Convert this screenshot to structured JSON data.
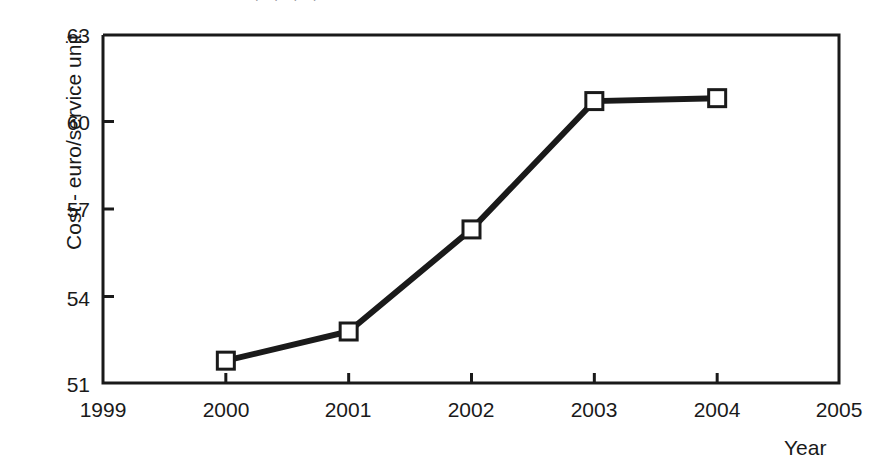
{
  "figure": {
    "width": 887,
    "height": 473,
    "background": "#ffffff",
    "top_clipped_text": ". . . ."
  },
  "plot_area": {
    "left": 103,
    "top": 34,
    "right": 840,
    "bottom": 384,
    "frame_color": "#1a1a1a",
    "frame_width": 3
  },
  "chart_data": {
    "type": "line",
    "title": "",
    "subtitle": "",
    "xlabel": "Year",
    "ylabel": "Cost - euro/service unit",
    "x": [
      2000,
      2001,
      2002,
      2003,
      2004
    ],
    "values": [
      51.8,
      52.8,
      56.3,
      60.7,
      60.8
    ],
    "series": [
      {
        "name": "Cost - euro/service unit",
        "x": [
          2000,
          2001,
          2002,
          2003,
          2004
        ],
        "values": [
          51.8,
          52.8,
          56.3,
          60.7,
          60.8
        ]
      }
    ],
    "xlim": [
      1999,
      2005
    ],
    "ylim": [
      51,
      63
    ],
    "xticks": [
      1999,
      2000,
      2001,
      2002,
      2003,
      2004,
      2005
    ],
    "xtick_labels": [
      "1999",
      "2000",
      "2001",
      "2002",
      "2003",
      "2004",
      "2005"
    ],
    "yticks": [
      51,
      54,
      57,
      60,
      63
    ],
    "ytick_labels": [
      "51",
      "54",
      "57",
      "60",
      "63"
    ],
    "grid": false,
    "legend": null,
    "legend_position": "none",
    "annotations": [],
    "line_color": "#1a1a1a",
    "line_width": 6,
    "marker": "square",
    "marker_size": 17,
    "marker_face_color": "#ffffff",
    "marker_edge_color": "#1a1a1a",
    "marker_edge_width": 3
  },
  "axis_labels": {
    "y_axis_title": "Cost - euro/service unit",
    "x_axis_title": "Year"
  }
}
